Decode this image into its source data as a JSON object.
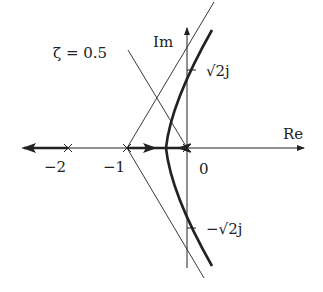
{
  "diagram": {
    "type": "root-locus",
    "axes": {
      "real_label": "Re",
      "imag_label": "Im"
    },
    "real_ticks": [
      {
        "label": "−2",
        "value": -2
      },
      {
        "label": "−1",
        "value": -1
      },
      {
        "label": "0",
        "value": 0
      }
    ],
    "imag_ticks": [
      {
        "label": "√2j",
        "value": 1.414
      },
      {
        "label": "−√2j",
        "value": -1.414
      }
    ],
    "poles": [
      0,
      -1,
      -2
    ],
    "damping_line_label": "ζ = 0.5",
    "colors": {
      "ink": "#222222",
      "background": "#ffffff"
    }
  }
}
